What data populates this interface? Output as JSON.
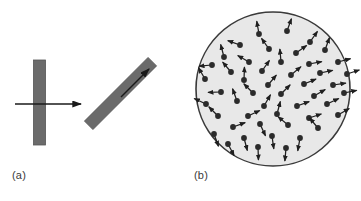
{
  "figure": {
    "width": 361,
    "height": 201,
    "background": "#ffffff",
    "type": "scientific-diagram"
  },
  "colors": {
    "bar_fill": "#6b6b6b",
    "bar_stroke": "#555555",
    "arrow_stroke": "#1a1a1a",
    "disc_fill": "#e8e8e8",
    "disc_stroke": "#3a3a3a",
    "dipole_dot": "#2b2b2b",
    "dipole_arrow": "#1f1f1f",
    "label_text": "#3a3a3a"
  },
  "panel_a": {
    "label": "(a)",
    "bars": [
      {
        "name": "vertical-bar",
        "cx": 39.5,
        "cy": 102.5,
        "length": 85,
        "thickness": 12,
        "angle": 0
      },
      {
        "name": "tilted-bar",
        "cx": 120.5,
        "cy": 93.5,
        "length": 90,
        "thickness": 12,
        "angle": 45
      }
    ],
    "arrows": [
      {
        "name": "incident-arrow",
        "x1": 15,
        "y1": 104,
        "x2": 81,
        "y2": 104
      },
      {
        "name": "transmitted-arrow",
        "x1": 121,
        "y1": 97,
        "x2": 149,
        "y2": 69
      }
    ]
  },
  "panel_b": {
    "label": "(b)",
    "disc": {
      "cx": 273,
      "cy": 89,
      "r": 77
    },
    "dipoles": [
      {
        "x": 259,
        "y": 34,
        "angle": -100
      },
      {
        "x": 287,
        "y": 31,
        "angle": -70
      },
      {
        "x": 240,
        "y": 45,
        "angle": -160
      },
      {
        "x": 310,
        "y": 42,
        "angle": -55
      },
      {
        "x": 224,
        "y": 57,
        "angle": -105
      },
      {
        "x": 269,
        "y": 49,
        "angle": -125
      },
      {
        "x": 296,
        "y": 53,
        "angle": -35
      },
      {
        "x": 325,
        "y": 50,
        "angle": -70
      },
      {
        "x": 212,
        "y": 65,
        "angle": -185
      },
      {
        "x": 249,
        "y": 62,
        "angle": -150
      },
      {
        "x": 281,
        "y": 62,
        "angle": -95
      },
      {
        "x": 338,
        "y": 62,
        "angle": -15
      },
      {
        "x": 231,
        "y": 72,
        "angle": -130
      },
      {
        "x": 262,
        "y": 71,
        "angle": -55
      },
      {
        "x": 309,
        "y": 64,
        "angle": -10
      },
      {
        "x": 205,
        "y": 79,
        "angle": -120
      },
      {
        "x": 244,
        "y": 80,
        "angle": -88
      },
      {
        "x": 291,
        "y": 75,
        "angle": -40
      },
      {
        "x": 320,
        "y": 73,
        "angle": -12
      },
      {
        "x": 347,
        "y": 74,
        "angle": -18
      },
      {
        "x": 268,
        "y": 85,
        "angle": -50
      },
      {
        "x": 304,
        "y": 84,
        "angle": -22
      },
      {
        "x": 333,
        "y": 85,
        "angle": -8
      },
      {
        "x": 221,
        "y": 92,
        "angle": 178
      },
      {
        "x": 253,
        "y": 93,
        "angle": -135
      },
      {
        "x": 281,
        "y": 94,
        "angle": -45
      },
      {
        "x": 314,
        "y": 96,
        "angle": -30
      },
      {
        "x": 344,
        "y": 93,
        "angle": -12
      },
      {
        "x": 206,
        "y": 104,
        "angle": -155
      },
      {
        "x": 237,
        "y": 101,
        "angle": -110
      },
      {
        "x": 264,
        "y": 106,
        "angle": -60
      },
      {
        "x": 297,
        "y": 106,
        "angle": -20
      },
      {
        "x": 327,
        "y": 104,
        "angle": -25
      },
      {
        "x": 218,
        "y": 116,
        "angle": -135
      },
      {
        "x": 248,
        "y": 116,
        "angle": -25
      },
      {
        "x": 277,
        "y": 114,
        "angle": -75
      },
      {
        "x": 309,
        "y": 118,
        "angle": -18
      },
      {
        "x": 338,
        "y": 115,
        "angle": -30
      },
      {
        "x": 233,
        "y": 127,
        "angle": -20
      },
      {
        "x": 260,
        "y": 124,
        "angle": 65
      },
      {
        "x": 288,
        "y": 125,
        "angle": -140
      },
      {
        "x": 318,
        "y": 128,
        "angle": -130
      },
      {
        "x": 214,
        "y": 134,
        "angle": 70
      },
      {
        "x": 244,
        "y": 138,
        "angle": 75
      },
      {
        "x": 272,
        "y": 136,
        "angle": 82
      },
      {
        "x": 300,
        "y": 138,
        "angle": 100
      },
      {
        "x": 228,
        "y": 144,
        "angle": 62
      },
      {
        "x": 258,
        "y": 147,
        "angle": 88
      },
      {
        "x": 286,
        "y": 148,
        "angle": 95
      }
    ]
  }
}
